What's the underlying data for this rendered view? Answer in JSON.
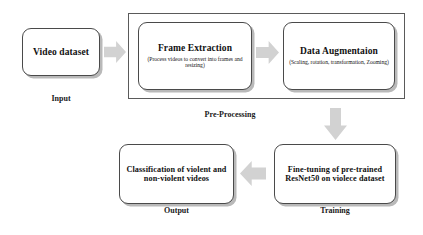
{
  "diagram": {
    "colors": {
      "box_border": "#4a4a4a",
      "box_shadow": "#b9b9b9",
      "arrow_fill": "#d2d2d2",
      "frame_border": "#5a5a5a",
      "text": "#111111",
      "background": "#ffffff"
    },
    "nodes": {
      "video_dataset": {
        "title": "Video dataset",
        "subtitle": "",
        "caption": "Input"
      },
      "frame_extraction": {
        "title": "Frame Extraction",
        "subtitle": "(Process videos to convert into frames and resizing)",
        "caption": ""
      },
      "data_augmentation": {
        "title": "Data Augmentaion",
        "subtitle": "(Scaling, rotation, transformation, Zooming)",
        "caption": ""
      },
      "fine_tuning": {
        "title": "Fine-tuning of pre-trained ResNet50 on violece dataset",
        "subtitle": "",
        "caption": "Training"
      },
      "classification": {
        "title": "Classification of violent and non-violent videos",
        "subtitle": "",
        "caption": "Output"
      }
    },
    "groups": {
      "preprocessing": {
        "caption": "Pre-Processing"
      }
    },
    "arrows": [
      {
        "name": "video-to-frame",
        "direction": "right"
      },
      {
        "name": "frame-to-augmentation",
        "direction": "right"
      },
      {
        "name": "augmentation-to-finetuning",
        "direction": "down"
      },
      {
        "name": "finetuning-to-classification",
        "direction": "left"
      }
    ]
  }
}
